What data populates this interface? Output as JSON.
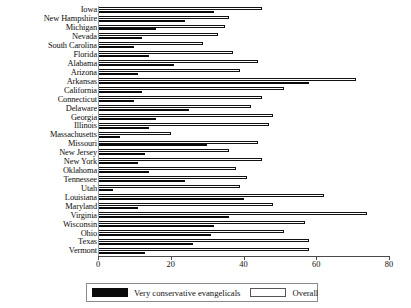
{
  "chart_data": {
    "type": "bar",
    "orientation": "horizontal",
    "title": "",
    "xlabel": "",
    "ylabel": "",
    "xlim": [
      0,
      80
    ],
    "xticks": [
      0,
      20,
      40,
      60,
      80
    ],
    "xtick_labels": [
      "0",
      "20",
      "40",
      "60",
      "80"
    ],
    "grid": false,
    "legend_position": "bottom",
    "categories": [
      "Iowa",
      "New Hampshire",
      "Michigan",
      "Nevada",
      "South Carolina",
      "Florida",
      "Alabama",
      "Arizona",
      "Arkansas",
      "California",
      "Connecticut",
      "Delaware",
      "Georgia",
      "Illinois",
      "Massachusetts",
      "Missouri",
      "New Jersey",
      "New York",
      "Oklahoma",
      "Tennessee",
      "Utah",
      "Louisiana",
      "Maryland",
      "Virginia",
      "Wisconsin",
      "Ohio",
      "Texas",
      "Vermont"
    ],
    "series": [
      {
        "name": "Very conservative evangelicals",
        "color": "#0a0a0a",
        "values": [
          32,
          24,
          16,
          12,
          10,
          14,
          21,
          11,
          58,
          12,
          10,
          25,
          16,
          14,
          6,
          30,
          13,
          11,
          14,
          24,
          4,
          40,
          11,
          36,
          32,
          31,
          26,
          13
        ]
      },
      {
        "name": "Overall",
        "color": "#ffffff",
        "values": [
          45,
          36,
          35,
          33,
          29,
          37,
          44,
          39,
          71,
          51,
          45,
          42,
          48,
          47,
          20,
          44,
          36,
          45,
          38,
          41,
          39,
          62,
          48,
          74,
          57,
          51,
          58,
          58
        ]
      }
    ]
  },
  "legend": {
    "items": [
      {
        "label": "Very conservative evangelicals",
        "swatch": "solid-black"
      },
      {
        "label": "Overall",
        "swatch": "outline-white"
      }
    ]
  }
}
